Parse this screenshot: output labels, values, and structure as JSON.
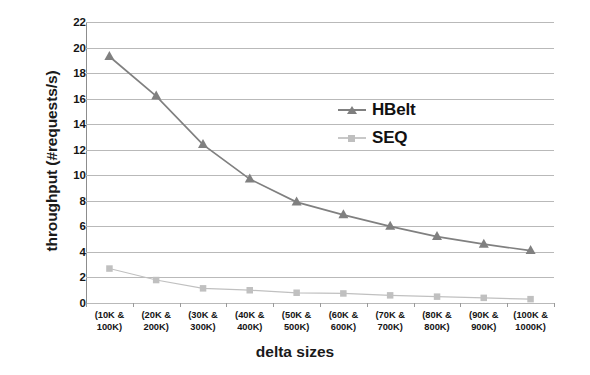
{
  "chart_data": {
    "type": "line",
    "title": "",
    "xlabel": "delta sizes",
    "ylabel": "throughput (#requests/s)",
    "categories": [
      "(10K & 100K)",
      "(20K & 200K)",
      "(30K & 300K)",
      "(40K & 400K)",
      "(50K & 500K)",
      "(60K & 600K)",
      "(70K & 700K)",
      "(80K & 800K)",
      "(90K & 900K)",
      "(100K & 1000K)"
    ],
    "category_lines": [
      [
        "(10K &",
        "100K)"
      ],
      [
        "(20K &",
        "200K)"
      ],
      [
        "(30K &",
        "300K)"
      ],
      [
        "(40K &",
        "400K)"
      ],
      [
        "(50K &",
        "500K)"
      ],
      [
        "(60K &",
        "600K)"
      ],
      [
        "(70K &",
        "700K)"
      ],
      [
        "(80K &",
        "800K)"
      ],
      [
        "(90K &",
        "900K)"
      ],
      [
        "(100K &",
        "1000K)"
      ]
    ],
    "series": [
      {
        "name": "HBelt",
        "marker": "triangle",
        "color": "#808080",
        "values": [
          19.3,
          16.2,
          12.4,
          9.7,
          7.9,
          6.9,
          6.0,
          5.2,
          4.6,
          4.1
        ]
      },
      {
        "name": "SEQ",
        "marker": "square",
        "color": "#c0c0c0",
        "values": [
          2.7,
          1.8,
          1.15,
          1.0,
          0.8,
          0.75,
          0.6,
          0.5,
          0.4,
          0.3
        ]
      }
    ],
    "ylim": [
      0,
      22
    ],
    "yticks": [
      0,
      2,
      4,
      6,
      8,
      10,
      12,
      14,
      16,
      18,
      20,
      22
    ],
    "ytick_labels": [
      "0",
      "2",
      "4",
      "6",
      "8",
      "10",
      "12",
      "14",
      "16",
      "18",
      "20",
      "22"
    ],
    "grid": true,
    "legend_position": "inside-upper-right"
  },
  "legend": [
    {
      "label": "HBelt"
    },
    {
      "label": "SEQ"
    }
  ],
  "colors": {
    "hbelt": "#808080",
    "seq": "#c0c0c0",
    "grid": "#b9b9b9",
    "axis": "#8d8d8d",
    "text": "#141414"
  }
}
